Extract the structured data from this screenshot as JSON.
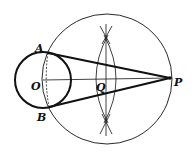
{
  "diagram": {
    "labels": {
      "A": "A",
      "B": "B",
      "O": "O",
      "Q": "Q",
      "P": "P"
    },
    "colors": {
      "ink": "#111111",
      "background": "#ffffff"
    }
  }
}
